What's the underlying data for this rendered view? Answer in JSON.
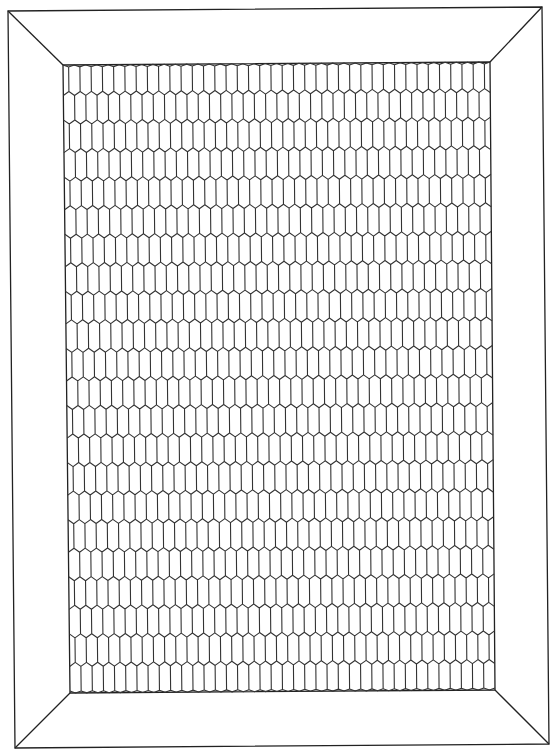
{
  "figure": {
    "width": 556,
    "height": 756,
    "stroke_color": "#222222",
    "background": "#ffffff"
  },
  "frame": {
    "outer": {
      "tl": [
        8,
        11
      ],
      "tr": [
        542,
        7
      ],
      "br": [
        549,
        744
      ],
      "bl": [
        15,
        748
      ]
    },
    "inner": {
      "tl": [
        63,
        65
      ],
      "tr": [
        490,
        62
      ],
      "br": [
        495,
        690
      ],
      "bl": [
        70,
        693
      ]
    }
  },
  "grid": {
    "pattern": "elongated-hexagon",
    "rows": 22,
    "cols": 38,
    "zigzag_depth": 4
  }
}
